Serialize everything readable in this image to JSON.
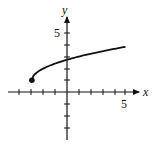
{
  "chart_data": {
    "type": "line",
    "title": "",
    "xlabel": "x",
    "ylabel": "y",
    "function": "y = sqrt(x + 3) + 1",
    "x_tick_label": "5",
    "y_tick_label": "5",
    "xlim": [
      -5,
      6
    ],
    "ylim": [
      -4,
      6
    ],
    "grid": false,
    "endpoint": {
      "x": -3,
      "y": 1,
      "style": "filled"
    },
    "series": [
      {
        "name": "curve",
        "x": [
          -3,
          -2.5,
          -2,
          -1,
          0,
          1,
          2,
          3,
          4,
          5
        ],
        "values": [
          1,
          1.71,
          2,
          2.41,
          2.73,
          3,
          3.24,
          3.45,
          3.65,
          3.83
        ]
      }
    ]
  },
  "axes": {
    "x_label": "x",
    "y_label": "y",
    "x_tick_5": "5",
    "y_tick_5": "5"
  }
}
